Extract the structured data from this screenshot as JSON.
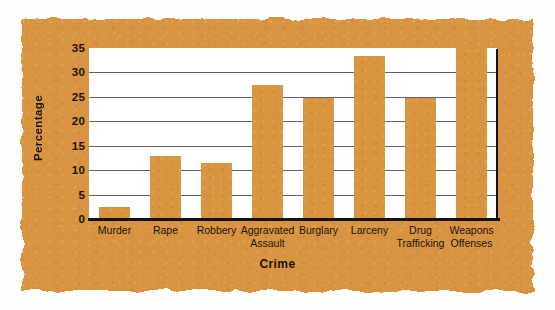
{
  "chart_data": {
    "type": "bar",
    "title": "",
    "xlabel": "Crime",
    "ylabel": "Percentage",
    "categories": [
      "Murder",
      "Rape",
      "Robbery",
      "Aggravated\nAssault",
      "Burglary",
      "Larceny",
      "Drug\nTrafficking",
      "Weapons\nOffenses"
    ],
    "values": [
      2.5,
      13.0,
      11.4,
      27.5,
      24.8,
      33.3,
      24.8,
      35.0
    ],
    "ylim": [
      0,
      35
    ],
    "yticks": [
      0,
      5,
      10,
      15,
      20,
      25,
      30,
      35
    ],
    "ytick_labels": [
      "0",
      "5",
      "10",
      "15",
      "20",
      "25",
      "30",
      "35"
    ],
    "grid": true,
    "legend": "none",
    "bar_color": "#d8943f",
    "plot_background": "#ffffff",
    "figure_background": "#d8943f",
    "gridline_color": "#5d6168",
    "axis_color": "#121212",
    "text_color": "#1b1408"
  }
}
